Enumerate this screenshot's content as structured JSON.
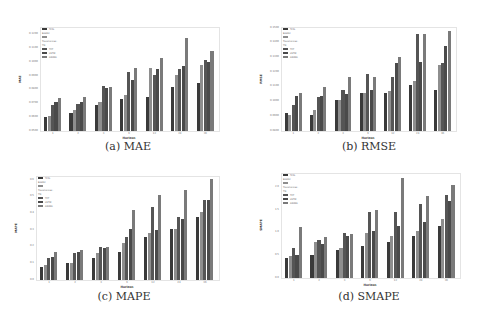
{
  "legend": [
    "TCN-BiGRU",
    "Transformer-TN",
    "TFT",
    "LSTM",
    "ARIMA"
  ],
  "colors": [
    "#3a3a3a",
    "#8e8e8e",
    "#555555",
    "#4a4a4a",
    "#7a7a7a"
  ],
  "chart_data": [
    {
      "type": "bar",
      "title": "(a) MAE",
      "xlabel": "Horizon",
      "ylabel": "MAE",
      "categories": [
        "1",
        "2",
        "3",
        "6",
        "12",
        "24",
        "36"
      ],
      "yticks": [
        "0.0500",
        "0.0600",
        "0.0700",
        "0.0800",
        "0.0900",
        "0.1000",
        "0.1100",
        "0.1200"
      ],
      "ylim": [
        0.05,
        0.125
      ],
      "series": [
        {
          "name": "TCN-BiGRU",
          "values": [
            0.06,
            0.063,
            0.069,
            0.073,
            0.075,
            0.082,
            0.085
          ]
        },
        {
          "name": "Transformer-TN",
          "values": [
            0.061,
            0.065,
            0.071,
            0.076,
            0.096,
            0.091,
            0.098
          ]
        },
        {
          "name": "TFT",
          "values": [
            0.069,
            0.07,
            0.083,
            0.093,
            0.091,
            0.095,
            0.102
          ]
        },
        {
          "name": "LSTM",
          "values": [
            0.071,
            0.071,
            0.081,
            0.087,
            0.095,
            0.097,
            0.1
          ]
        },
        {
          "name": "ARIMA",
          "values": [
            0.074,
            0.075,
            0.082,
            0.096,
            0.103,
            0.118,
            0.108
          ]
        }
      ],
      "legend_position": "upper left",
      "grid": false
    },
    {
      "type": "bar",
      "title": "(b) RMSE",
      "xlabel": "Horizon",
      "ylabel": "RMSE",
      "categories": [
        "1",
        "2",
        "3",
        "6",
        "12",
        "24",
        "36"
      ],
      "yticks": [
        "0.0800",
        "0.0900",
        "0.1000",
        "0.1100",
        "0.1200",
        "0.1300",
        "0.1400",
        "0.1500"
      ],
      "ylim": [
        0.08,
        0.15
      ],
      "series": [
        {
          "name": "TCN-BiGRU",
          "values": [
            0.092,
            0.091,
            0.101,
            0.106,
            0.106,
            0.111,
            0.108
          ]
        },
        {
          "name": "Transformer-TN",
          "values": [
            0.091,
            0.094,
            0.101,
            0.106,
            0.107,
            0.114,
            0.125
          ]
        },
        {
          "name": "TFT",
          "values": [
            0.098,
            0.103,
            0.108,
            0.119,
            0.117,
            0.146,
            0.126
          ]
        },
        {
          "name": "LSTM",
          "values": [
            0.104,
            0.104,
            0.105,
            0.108,
            0.126,
            0.127,
            0.138
          ]
        },
        {
          "name": "ARIMA",
          "values": [
            0.106,
            0.11,
            0.117,
            0.117,
            0.13,
            0.146,
            0.148
          ]
        }
      ],
      "legend_position": "upper left",
      "grid": false
    },
    {
      "type": "bar",
      "title": "(c) MAPE",
      "xlabel": "Horizon",
      "ylabel": "MAPE",
      "categories": [
        "1",
        "2",
        "3",
        "6",
        "12",
        "24",
        "36"
      ],
      "yticks": [
        "0.0",
        "0.1",
        "0.2",
        "0.3",
        "0.4",
        "0.5",
        "0.6"
      ],
      "ylim": [
        0.0,
        0.62
      ],
      "series": [
        {
          "name": "TCN-BiGRU",
          "values": [
            0.08,
            0.1,
            0.13,
            0.17,
            0.26,
            0.31,
            0.38
          ]
        },
        {
          "name": "Transformer-TN",
          "values": [
            0.09,
            0.1,
            0.16,
            0.22,
            0.28,
            0.31,
            0.41
          ]
        },
        {
          "name": "TFT",
          "values": [
            0.13,
            0.16,
            0.2,
            0.26,
            0.44,
            0.38,
            0.48
          ]
        },
        {
          "name": "LSTM",
          "values": [
            0.14,
            0.17,
            0.19,
            0.31,
            0.3,
            0.37,
            0.48
          ]
        },
        {
          "name": "ARIMA",
          "values": [
            0.17,
            0.18,
            0.2,
            0.42,
            0.51,
            0.54,
            0.61
          ]
        }
      ],
      "legend_position": "upper left",
      "grid": false
    },
    {
      "type": "bar",
      "title": "(d) SMAPE",
      "xlabel": "Horizon",
      "ylabel": "SMAPE",
      "categories": [
        "1",
        "2",
        "3",
        "6",
        "12",
        "24",
        "36"
      ],
      "yticks": [
        "0.0",
        "0.5",
        "1.0",
        "1.5",
        "2.0"
      ],
      "ylim": [
        0.0,
        2.3
      ],
      "series": [
        {
          "name": "TCN-BiGRU",
          "values": [
            0.45,
            0.5,
            0.62,
            0.7,
            0.8,
            0.93,
            1.16
          ]
        },
        {
          "name": "Transformer-TN",
          "values": [
            0.48,
            0.8,
            0.66,
            1.0,
            0.92,
            1.03,
            1.31
          ]
        },
        {
          "name": "TFT",
          "values": [
            0.67,
            0.83,
            1.0,
            1.47,
            1.47,
            1.64,
            1.84
          ]
        },
        {
          "name": "LSTM",
          "values": [
            0.5,
            0.75,
            0.93,
            1.03,
            1.14,
            1.24,
            1.7
          ]
        },
        {
          "name": "ARIMA",
          "values": [
            1.13,
            0.9,
            0.98,
            1.51,
            2.21,
            1.82,
            2.06
          ]
        }
      ],
      "legend_position": "upper left",
      "grid": false
    }
  ]
}
